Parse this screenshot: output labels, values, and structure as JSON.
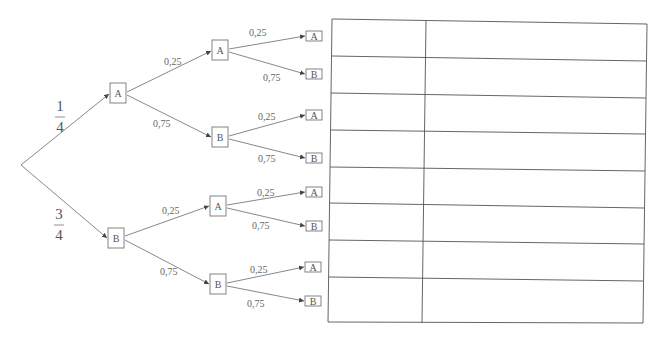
{
  "tree": {
    "root": {
      "x": 21,
      "y": 165
    },
    "level1": [
      {
        "id": "n1",
        "label": "A",
        "prob": "1/4",
        "prob_num": "1",
        "prob_den": "4",
        "cx": 118,
        "cy": 93
      },
      {
        "id": "n2",
        "label": "B",
        "prob": "3/4",
        "prob_num": "3",
        "prob_den": "4",
        "cx": 116,
        "cy": 238
      }
    ],
    "level2": [
      {
        "id": "n11",
        "parent": "n1",
        "label": "A",
        "prob": "0,25",
        "cx": 220,
        "cy": 50
      },
      {
        "id": "n12",
        "parent": "n1",
        "label": "B",
        "prob": "0,75",
        "cx": 220,
        "cy": 137
      },
      {
        "id": "n21",
        "parent": "n2",
        "label": "A",
        "prob": "0,25",
        "cx": 218,
        "cy": 206
      },
      {
        "id": "n22",
        "parent": "n2",
        "label": "B",
        "prob": "0,75",
        "cx": 218,
        "cy": 284
      }
    ],
    "level3": [
      {
        "parent": "n11",
        "label": "A",
        "prob": "0,25",
        "cx": 314,
        "cy": 36
      },
      {
        "parent": "n11",
        "label": "B",
        "prob": "0,75",
        "cx": 314,
        "cy": 74
      },
      {
        "parent": "n12",
        "label": "A",
        "prob": "0,25",
        "cx": 314,
        "cy": 115
      },
      {
        "parent": "n12",
        "label": "B",
        "prob": "0,75",
        "cx": 314,
        "cy": 158
      },
      {
        "parent": "n21",
        "label": "A",
        "prob": "0,25",
        "cx": 314,
        "cy": 192
      },
      {
        "parent": "n21",
        "label": "B",
        "prob": "0,75",
        "cx": 314,
        "cy": 226
      },
      {
        "parent": "n22",
        "label": "A",
        "prob": "0,25",
        "cx": 313,
        "cy": 267
      },
      {
        "parent": "n22",
        "label": "B",
        "prob": "0,75",
        "cx": 313,
        "cy": 301
      }
    ]
  },
  "labels": {
    "frac1_num": "1",
    "frac1_den": "4",
    "frac2_num": "3",
    "frac2_den": "4",
    "l2_n1_top": "0,25",
    "l2_n1_bot": "0,75",
    "l2_n2_top": "0,25",
    "l2_n2_bot": "0,75",
    "l3_a1": "0,25",
    "l3_a2": "0,75",
    "l3_b1": "0,25",
    "l3_b2": "0,75",
    "l3_c1": "0,25",
    "l3_c2": "0,75",
    "l3_d1": "0,25",
    "l3_d2": "0,75",
    "n1": "A",
    "n2": "B",
    "n11": "A",
    "n12": "B",
    "n21": "A",
    "n22": "B",
    "leaf1": "A",
    "leaf2": "B",
    "leaf3": "A",
    "leaf4": "B",
    "leaf5": "A",
    "leaf6": "B",
    "leaf7": "A",
    "leaf8": "B"
  },
  "table": {
    "rows": 8,
    "columns": 2,
    "cells": [
      [
        "",
        ""
      ],
      [
        "",
        ""
      ],
      [
        "",
        ""
      ],
      [
        "",
        ""
      ],
      [
        "",
        ""
      ],
      [
        "",
        ""
      ],
      [
        "",
        ""
      ],
      [
        "",
        ""
      ]
    ]
  }
}
